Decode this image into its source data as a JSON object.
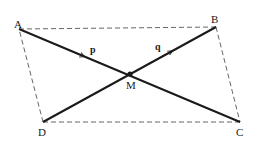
{
  "diagram": {
    "points": {
      "A": {
        "label": "A",
        "x": 19,
        "y": 29
      },
      "B": {
        "label": "B",
        "x": 216,
        "y": 27
      },
      "C": {
        "label": "C",
        "x": 240,
        "y": 122
      },
      "D": {
        "label": "D",
        "x": 43,
        "y": 122
      },
      "M": {
        "label": "M",
        "x": 130,
        "y": 74
      }
    },
    "vectors": {
      "p": {
        "label": "p",
        "from": "A",
        "to": "M"
      },
      "q": {
        "label": "q",
        "from": "M",
        "to": "B"
      }
    },
    "edges_dashed": [
      "AB",
      "BC",
      "CD",
      "DA"
    ],
    "edges_solid": [
      "AC",
      "DB"
    ],
    "colors": {
      "line": "#1a1a1a",
      "dashed": "#555555",
      "background": "#ffffff"
    }
  }
}
